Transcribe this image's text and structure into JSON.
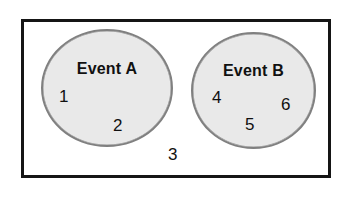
{
  "diagram": {
    "type": "venn-diagram",
    "sample_space": {
      "name": "sample-space-rectangle",
      "border_color": "#151515"
    },
    "events": [
      {
        "id": "A",
        "label": "Event A",
        "fill_color": "#e9e9e9",
        "border_color": "#808080",
        "outcomes": [
          "1",
          "2"
        ]
      },
      {
        "id": "B",
        "label": "Event B",
        "fill_color": "#e9e9e9",
        "border_color": "#808080",
        "outcomes": [
          "4",
          "5",
          "6"
        ]
      }
    ],
    "outside_outcomes": [
      "3"
    ],
    "outcomes": {
      "one": "1",
      "two": "2",
      "three": "3",
      "four": "4",
      "five": "5",
      "six": "6"
    }
  }
}
